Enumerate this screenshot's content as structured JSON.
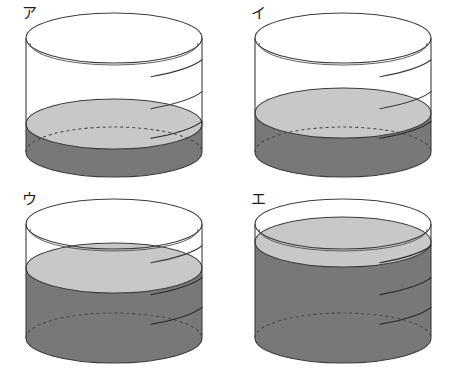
{
  "figure": {
    "background_color": "#ffffff",
    "columns": 2,
    "rows": 2
  },
  "style": {
    "outline_color": "#3c3c3c",
    "outline_color_light": "#555555",
    "liquid_body_color": "#787878",
    "liquid_surface_color": "#c8c8c8",
    "glass_fill_color": "#ffffff",
    "hidden_edge_style": "dashed",
    "stroke_width": 1.1
  },
  "geometry": {
    "cell_width": 229,
    "cell_height": 186,
    "cylinder_center_x": 114,
    "cylinder_radius_x": 88,
    "cylinder_radius_y": 25,
    "top_rim_y": 38,
    "bottom_rim_y": 152
  },
  "cylinders": [
    {
      "id": "cyl-a",
      "label": "ア",
      "label_romaji": "a",
      "position": "top-left",
      "fill_fraction": 0.25,
      "fill_percent_text": "25%",
      "surface_y": 124,
      "description": "cylinder with lowest liquid level"
    },
    {
      "id": "cyl-i",
      "label": "イ",
      "label_romaji": "i",
      "position": "top-right",
      "fill_fraction": 0.35,
      "fill_percent_text": "35%",
      "surface_y": 113,
      "description": "cylinder with low liquid level"
    },
    {
      "id": "cyl-u",
      "label": "ウ",
      "label_romaji": "u",
      "position": "bottom-left",
      "fill_fraction": 0.62,
      "fill_percent_text": "62%",
      "surface_y": 82,
      "description": "cylinder with high liquid level"
    },
    {
      "id": "cyl-e",
      "label": "エ",
      "label_romaji": "e",
      "position": "bottom-right",
      "fill_fraction": 0.85,
      "fill_percent_text": "85%",
      "surface_y": 56,
      "description": "cylinder with highest liquid level, nearly full"
    }
  ]
}
